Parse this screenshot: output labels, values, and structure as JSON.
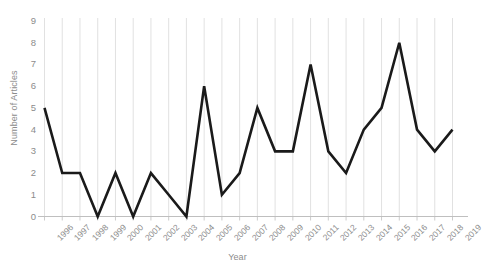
{
  "chart_data": {
    "type": "line",
    "title": "",
    "xlabel": "Year",
    "ylabel": "Number of Articles",
    "categories": [
      "1996",
      "1997",
      "1998",
      "1999",
      "2000",
      "2001",
      "2002",
      "2003",
      "2004",
      "2005",
      "2006",
      "2007",
      "2008",
      "2009",
      "2010",
      "2011",
      "2012",
      "2013",
      "2014",
      "2015",
      "2016",
      "2017",
      "2018",
      "2019"
    ],
    "values": [
      5,
      2,
      2,
      0,
      2,
      0,
      2,
      1,
      0,
      6,
      1,
      2,
      5,
      3,
      3,
      7,
      3,
      2,
      4,
      5,
      8,
      4,
      3,
      4
    ],
    "series": [
      {
        "name": "Number of Articles",
        "values": [
          5,
          2,
          2,
          0,
          2,
          0,
          2,
          1,
          0,
          6,
          1,
          2,
          5,
          3,
          3,
          7,
          3,
          2,
          4,
          5,
          8,
          4,
          3,
          4
        ]
      }
    ],
    "yticks": [
      "0",
      "1",
      "2",
      "3",
      "4",
      "5",
      "6",
      "7",
      "8",
      "9"
    ],
    "ylim": [
      0,
      9
    ],
    "grid": "vertical-only",
    "legend": "none",
    "line_color": "#1a1a1a",
    "axis_color": "#bfbfbf",
    "gridline_color": "#d9d9d9",
    "tick_label_color": "#8c8c8c",
    "axis_title_color": "#8c8c8c"
  }
}
